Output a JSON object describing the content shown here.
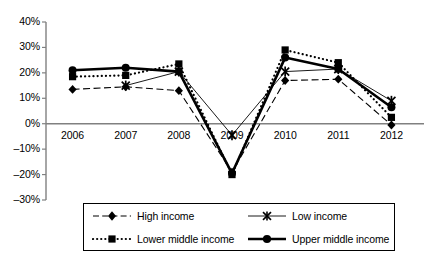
{
  "chart_data": {
    "type": "line",
    "title": "",
    "xlabel": "",
    "ylabel": "",
    "x": [
      "2006",
      "2007",
      "2008",
      "2009",
      "2010",
      "2011",
      "2012"
    ],
    "categories": [
      "2006",
      "2007",
      "2008",
      "2009",
      "2010",
      "2011",
      "2012"
    ],
    "ylim": [
      -30,
      40
    ],
    "ytick_values": [
      40,
      30,
      20,
      10,
      0,
      -10,
      -20,
      -30
    ],
    "ytick_labels": [
      "40%",
      "30%",
      "20%",
      "10%",
      "0%",
      "–10%",
      "–20%",
      "–30%"
    ],
    "grid": false,
    "legend_position": "bottom",
    "axis_color": "#808080",
    "series": [
      {
        "name": "High income",
        "values": [
          13.5,
          14.5,
          13.0,
          -19.0,
          17.0,
          17.5,
          -0.5
        ],
        "line_style": "dashed",
        "marker": "diamond",
        "color": "#000000",
        "line_width": 1.1
      },
      {
        "name": "Low income",
        "values": [
          null,
          15.0,
          20.5,
          -4.5,
          20.5,
          21.5,
          9.0
        ],
        "line_style": "solid",
        "marker": "star",
        "color": "#000000",
        "line_width": 0.9
      },
      {
        "name": "Lower middle income",
        "values": [
          18.5,
          19.0,
          23.5,
          -20.0,
          29.0,
          24.0,
          2.5
        ],
        "line_style": "dotted",
        "marker": "square",
        "color": "#000000",
        "line_width": 2.2
      },
      {
        "name": "Upper middle income",
        "values": [
          21.0,
          22.0,
          20.5,
          -19.5,
          26.0,
          21.5,
          6.5
        ],
        "line_style": "solid",
        "marker": "circle",
        "color": "#000000",
        "line_width": 2.6
      }
    ]
  },
  "legend": {
    "items": [
      {
        "label": "High income"
      },
      {
        "label": "Low income"
      },
      {
        "label": "Lower middle income"
      },
      {
        "label": "Upper middle income"
      }
    ]
  }
}
